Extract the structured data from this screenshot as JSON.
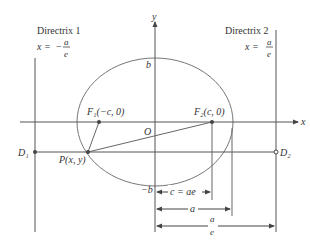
{
  "diagram": {
    "directrix1": {
      "title": "Directrix 1",
      "eq_lhs": "x =",
      "eq_sign": "−",
      "eq_num": "a",
      "eq_den": "e"
    },
    "directrix2": {
      "title": "Directrix 2",
      "eq_lhs": "x =",
      "eq_num": "a",
      "eq_den": "e"
    },
    "axes": {
      "x_label": "x",
      "y_label": "y",
      "origin_label": "O"
    },
    "points": {
      "f1": "F₁(−c, 0)",
      "f2": "F₂(c, 0)",
      "p": "P(x, y)",
      "d1": "D₁",
      "d2": "D₂"
    },
    "intercepts": {
      "b_top": "b",
      "b_bottom": "−b"
    },
    "dimensions": {
      "c": "c = ae",
      "a": "a",
      "a_over_e_num": "a",
      "a_over_e_den": "e"
    },
    "colors": {
      "line": "#555555",
      "curve": "#777777"
    }
  }
}
